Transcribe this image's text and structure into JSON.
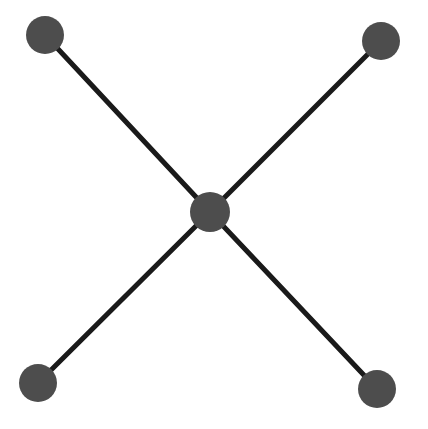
{
  "figure": {
    "type": "node-link-diagram",
    "shape_name": "star-graph",
    "background_color": "#ffffff",
    "width": 428,
    "height": 429
  },
  "style": {
    "node_fill": "#4d4d4d",
    "node_stroke": "none",
    "edge_color": "#1a1a1a",
    "edge_width": 5
  },
  "graph_data": {
    "node_count": 5,
    "edge_count": 4,
    "nodes": [
      {
        "id": "center",
        "label": "center",
        "cx": 210,
        "cy": 212,
        "r": 20,
        "fill": "#4d4d4d"
      },
      {
        "id": "top-left",
        "label": "top-left",
        "cx": 45,
        "cy": 35,
        "r": 19,
        "fill": "#4d4d4d"
      },
      {
        "id": "top-right",
        "label": "top-right",
        "cx": 381,
        "cy": 41,
        "r": 19,
        "fill": "#4d4d4d"
      },
      {
        "id": "bottom-left",
        "label": "bottom-left",
        "cx": 38,
        "cy": 383,
        "r": 19,
        "fill": "#4d4d4d"
      },
      {
        "id": "bottom-right",
        "label": "bottom-right",
        "cx": 377,
        "cy": 389,
        "r": 19,
        "fill": "#4d4d4d"
      }
    ],
    "edges": [
      {
        "id": "edge-center-top-left",
        "source": "center",
        "target": "top-left",
        "x1": 210,
        "y1": 212,
        "x2": 45,
        "y2": 35
      },
      {
        "id": "edge-center-top-right",
        "source": "center",
        "target": "top-right",
        "x1": 210,
        "y1": 212,
        "x2": 381,
        "y2": 41
      },
      {
        "id": "edge-center-bottom-left",
        "source": "center",
        "target": "bottom-left",
        "x1": 210,
        "y1": 212,
        "x2": 38,
        "y2": 383
      },
      {
        "id": "edge-center-bottom-right",
        "source": "center",
        "target": "bottom-right",
        "x1": 210,
        "y1": 212,
        "x2": 377,
        "y2": 389
      }
    ]
  }
}
